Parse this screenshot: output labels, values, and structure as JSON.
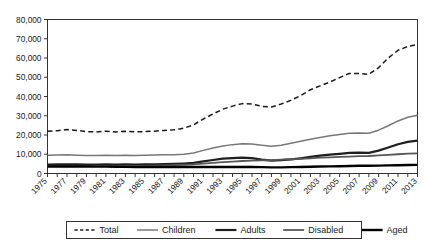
{
  "chart_data": {
    "type": "line",
    "title": "",
    "xlabel": "",
    "ylabel": "",
    "xlim": [
      1975,
      2013
    ],
    "ylim": [
      0,
      80000
    ],
    "grid": false,
    "legend_position": "bottom",
    "ytick_labels": [
      "80,000",
      "70,000",
      "60,000",
      "50,000",
      "40,000",
      "30,000",
      "20,000",
      "10,000",
      "0"
    ],
    "ytick_values": [
      80000,
      70000,
      60000,
      50000,
      40000,
      30000,
      20000,
      10000,
      0
    ],
    "x": [
      1975,
      1976,
      1977,
      1978,
      1979,
      1980,
      1981,
      1982,
      1983,
      1984,
      1985,
      1986,
      1987,
      1988,
      1989,
      1990,
      1991,
      1992,
      1993,
      1994,
      1995,
      1996,
      1997,
      1998,
      1999,
      2000,
      2001,
      2002,
      2003,
      2004,
      2005,
      2006,
      2007,
      2008,
      2009,
      2010,
      2011,
      2012,
      2013
    ],
    "xtick_labels": [
      "1975",
      "1977",
      "1979",
      "1981",
      "1983",
      "1985",
      "1987",
      "1989",
      "1991",
      "1993",
      "1995",
      "1997",
      "1999",
      "2001",
      "2003",
      "2005",
      "2007",
      "2009",
      "2011",
      "2013"
    ],
    "xtick_values": [
      1975,
      1977,
      1979,
      1981,
      1983,
      1985,
      1987,
      1989,
      1991,
      1993,
      1995,
      1997,
      1999,
      2001,
      2003,
      2005,
      2007,
      2009,
      2011,
      2013
    ],
    "series": [
      {
        "name": "Total",
        "style": "dashed",
        "color": "#1a1a1a",
        "width": 1.5,
        "values": [
          22000,
          22200,
          22800,
          22400,
          21700,
          21600,
          22000,
          21600,
          21900,
          21600,
          21800,
          22000,
          22400,
          22700,
          23500,
          25300,
          28300,
          30900,
          33400,
          35000,
          36300,
          36100,
          34900,
          34500,
          36100,
          38000,
          40500,
          43500,
          45500,
          47500,
          49800,
          52000,
          52000,
          51500,
          55000,
          60000,
          64000,
          66000,
          67000
        ]
      },
      {
        "name": "Children",
        "style": "solid",
        "color": "#787878",
        "width": 1.5,
        "values": [
          9500,
          9600,
          9700,
          9500,
          9300,
          9400,
          9500,
          9400,
          9500,
          9400,
          9500,
          9600,
          9700,
          9800,
          10000,
          10600,
          12000,
          13300,
          14300,
          15000,
          15500,
          15300,
          14700,
          14200,
          14700,
          15700,
          16700,
          17800,
          18700,
          19600,
          20300,
          20900,
          21000,
          20900,
          22500,
          24800,
          27300,
          29200,
          30300
        ]
      },
      {
        "name": "Adults",
        "style": "solid",
        "color": "#1f1f1f",
        "width": 2.2,
        "values": [
          4600,
          4700,
          4800,
          4700,
          4600,
          4600,
          4700,
          4600,
          4700,
          4600,
          4700,
          4800,
          4900,
          5000,
          5200,
          5500,
          6300,
          7000,
          7700,
          8000,
          8200,
          8000,
          7200,
          6700,
          6900,
          7300,
          7900,
          8600,
          9300,
          9800,
          10200,
          10700,
          10800,
          10700,
          11900,
          13500,
          15200,
          16400,
          17100
        ]
      },
      {
        "name": "Disabled",
        "style": "solid",
        "color": "#575757",
        "width": 1.8,
        "values": [
          3900,
          3950,
          4000,
          3950,
          3900,
          3900,
          3950,
          3900,
          3950,
          3950,
          4000,
          4100,
          4200,
          4350,
          4500,
          4700,
          5100,
          5500,
          5900,
          6200,
          6500,
          6700,
          6800,
          7000,
          7200,
          7400,
          7600,
          7900,
          8200,
          8400,
          8600,
          8800,
          9000,
          9100,
          9400,
          9700,
          10000,
          10300,
          10500
        ]
      },
      {
        "name": "Aged",
        "style": "solid",
        "color": "#000000",
        "width": 2.4,
        "values": [
          3600,
          3600,
          3650,
          3650,
          3600,
          3550,
          3550,
          3500,
          3450,
          3400,
          3400,
          3400,
          3400,
          3400,
          3400,
          3400,
          3400,
          3400,
          3400,
          3400,
          3400,
          3400,
          3300,
          3200,
          3200,
          3300,
          3400,
          3500,
          3600,
          3700,
          3800,
          3900,
          4000,
          4000,
          4100,
          4200,
          4300,
          4400,
          4500
        ]
      }
    ]
  },
  "legend": {
    "items": [
      {
        "label": "Total"
      },
      {
        "label": "Children"
      },
      {
        "label": "Adults"
      },
      {
        "label": "Disabled"
      },
      {
        "label": "Aged"
      }
    ]
  },
  "axis_colors": {
    "axis_line": "#333333",
    "plot_border": "#333333",
    "background": "#ffffff"
  }
}
